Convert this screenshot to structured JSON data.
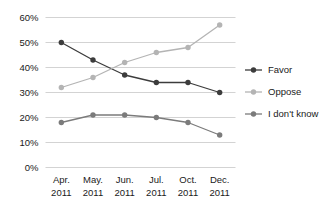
{
  "chart_data": {
    "type": "line",
    "title": "",
    "xlabel": "",
    "ylabel": "",
    "categories": [
      "Apr. 2011",
      "May. 2011",
      "Jun. 2011",
      "Jul. 2011",
      "Oct. 2011",
      "Dec. 2011"
    ],
    "category_lines": [
      [
        "Apr.",
        "2011"
      ],
      [
        "May.",
        "2011"
      ],
      [
        "Jun.",
        "2011"
      ],
      [
        "Jul.",
        "2011"
      ],
      [
        "Oct.",
        "2011"
      ],
      [
        "Dec.",
        "2011"
      ]
    ],
    "series": [
      {
        "name": "Favor",
        "color": "#3c3c3c",
        "values": [
          50,
          43,
          37,
          34,
          34,
          30
        ]
      },
      {
        "name": "Oppose",
        "color": "#b4b4b4",
        "values": [
          32,
          36,
          42,
          46,
          48,
          57
        ]
      },
      {
        "name": "I don't know",
        "color": "#7b7b7b",
        "values": [
          18,
          21,
          21,
          20,
          18,
          13
        ]
      }
    ],
    "ylim": [
      0,
      60
    ],
    "yticks": [
      0,
      10,
      20,
      30,
      40,
      50,
      60
    ],
    "ytick_labels": [
      "0%",
      "10%",
      "20%",
      "30%",
      "40%",
      "50%",
      "60%"
    ],
    "grid": true,
    "grid_color": "#c8c8c8",
    "legend_position": "right",
    "legend_entries": [
      "Favor",
      "Oppose",
      "I don't know"
    ],
    "background": "#ffffff"
  }
}
